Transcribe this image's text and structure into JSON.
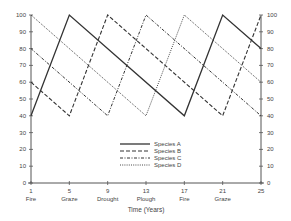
{
  "chart_data": {
    "type": "line",
    "title": "",
    "xlabel": "Time (Years)",
    "ylabel": "",
    "xlim": [
      1,
      25
    ],
    "ylim": [
      0,
      100
    ],
    "grid": false,
    "x_ticks": [
      1,
      5,
      9,
      13,
      17,
      21,
      25
    ],
    "x_tick_sublabels": [
      "Fire",
      "Graze",
      "Drought",
      "Plough",
      "Fire",
      "Graze",
      ""
    ],
    "y_ticks": [
      0,
      10,
      20,
      30,
      40,
      50,
      60,
      70,
      80,
      90,
      100
    ],
    "y_axis_right": true,
    "legend_position": "center-right-inside",
    "series": [
      {
        "name": "Species A",
        "style": "solid",
        "x": [
          1,
          5,
          17,
          21,
          25
        ],
        "y": [
          40,
          100,
          40,
          100,
          80
        ]
      },
      {
        "name": "Species B",
        "style": "dashed",
        "x": [
          1,
          5,
          9,
          21,
          25
        ],
        "y": [
          60,
          40,
          100,
          40,
          100
        ]
      },
      {
        "name": "Species C",
        "style": "dash-dot",
        "x": [
          1,
          9,
          13,
          25
        ],
        "y": [
          80,
          40,
          100,
          40
        ]
      },
      {
        "name": "Species D",
        "style": "dotted",
        "x": [
          1,
          13,
          17,
          25
        ],
        "y": [
          100,
          40,
          100,
          60
        ]
      }
    ]
  },
  "colors": {
    "line": "#333333",
    "axis": "#555555",
    "text": "#444444"
  }
}
